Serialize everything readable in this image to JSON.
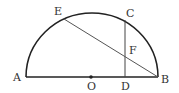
{
  "diagram": {
    "type": "semicircle-geometry",
    "colors": {
      "stroke": "#222222",
      "chord": "#555555",
      "label": "#333333",
      "background": "#ffffff"
    },
    "points": {
      "A": {
        "label": "A"
      },
      "B": {
        "label": "B"
      },
      "C": {
        "label": "C"
      },
      "D": {
        "label": "D"
      },
      "E": {
        "label": "E"
      },
      "F": {
        "label": "F"
      },
      "O": {
        "label": "O"
      }
    },
    "segments": [
      "AB",
      "CD",
      "EB"
    ],
    "arc": "semicircle with diameter AB, center O"
  }
}
